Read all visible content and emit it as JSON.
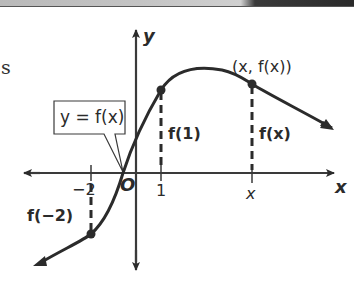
{
  "banner": {
    "description": "top photo strip"
  },
  "side_text": "s",
  "axes": {
    "x_label": "x",
    "y_label": "y",
    "origin_label": "O"
  },
  "ticks": {
    "neg_two": "−2",
    "one": "1",
    "x": "x"
  },
  "callout": {
    "text": "y = f(x)"
  },
  "labels": {
    "point_label": "(x, f(x))",
    "f_of_1": "f(1)",
    "f_of_x": "f(x)",
    "f_of_neg2": "f(−2)"
  },
  "colors": {
    "ink": "#2b2b2b",
    "background": "#ffffff"
  }
}
